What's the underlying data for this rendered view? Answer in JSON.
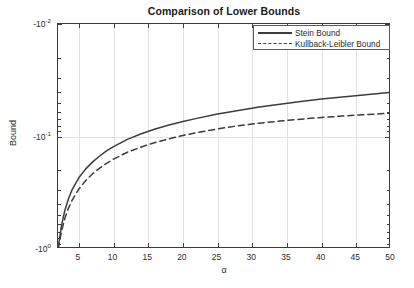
{
  "chart_data": {
    "type": "line",
    "title": "Comparison of Lower Bounds",
    "xlabel": "α",
    "ylabel": "Bound",
    "xlim": [
      2,
      50
    ],
    "ylim": [
      -1,
      -0.01
    ],
    "yscale": "reverse-log",
    "grid": true,
    "legend_position": "top-right",
    "xticks": [
      5,
      10,
      15,
      20,
      25,
      30,
      35,
      40,
      45,
      50
    ],
    "xticklabels": [
      "5",
      "10",
      "15",
      "20",
      "25",
      "30",
      "35",
      "40",
      "45",
      "50"
    ],
    "yticks": [
      -1,
      -0.1,
      -0.01
    ],
    "yticklabels": [
      "-10",
      "-10",
      "-10"
    ],
    "yticklabel_exponents": [
      "0",
      "-1",
      "-2"
    ],
    "series": [
      {
        "name": "Stein Bound",
        "style": "solid",
        "color": "#3c3c3c",
        "x": [
          2,
          2.5,
          3,
          3.5,
          4,
          5,
          6,
          7,
          8,
          9,
          10,
          12,
          14,
          16,
          18,
          20,
          22,
          25,
          28,
          31,
          34,
          37,
          40,
          43,
          46,
          50
        ],
        "y": [
          -1.0,
          -0.62,
          -0.45,
          -0.36,
          -0.3,
          -0.233,
          -0.194,
          -0.168,
          -0.149,
          -0.134,
          -0.123,
          -0.106,
          -0.0945,
          -0.0859,
          -0.0791,
          -0.0736,
          -0.069,
          -0.0632,
          -0.0586,
          -0.0548,
          -0.0516,
          -0.0489,
          -0.0465,
          -0.0445,
          -0.0427,
          -0.0405
        ]
      },
      {
        "name": "Kullback-Leibler Bound",
        "style": "dashed",
        "color": "#3c3c3c",
        "x": [
          2,
          2.5,
          3,
          3.5,
          4,
          5,
          6,
          7,
          8,
          9,
          10,
          12,
          14,
          16,
          18,
          20,
          22,
          25,
          28,
          31,
          34,
          37,
          40,
          43,
          46,
          50
        ],
        "y": [
          -1.0,
          -0.7,
          -0.53,
          -0.435,
          -0.372,
          -0.293,
          -0.246,
          -0.214,
          -0.191,
          -0.173,
          -0.159,
          -0.138,
          -0.124,
          -0.113,
          -0.105,
          -0.0979,
          -0.0924,
          -0.0855,
          -0.0803,
          -0.0762,
          -0.0729,
          -0.0701,
          -0.0678,
          -0.0658,
          -0.0641,
          -0.0621
        ]
      }
    ]
  },
  "chart": {
    "title": "Comparison of Lower Bounds",
    "xlabel": "α",
    "ylabel": "Bound",
    "xticklabels": [
      "5",
      "10",
      "15",
      "20",
      "25",
      "30",
      "35",
      "40",
      "45",
      "50"
    ],
    "yticks": [
      {
        "mantissa": "-10",
        "exponent": "-2"
      },
      {
        "mantissa": "-10",
        "exponent": "-1"
      },
      {
        "mantissa": "-10",
        "exponent": "0"
      }
    ],
    "legend": [
      {
        "label": "Stein Bound",
        "style": "solid"
      },
      {
        "label": "Kullback-Leibler Bound",
        "style": "dashed"
      }
    ],
    "colors": {
      "line": "#3c3c3c",
      "grid": "#e2e2e2",
      "axis": "#3c3c3c",
      "background": "#ffffff",
      "text": "#2b2b2b"
    }
  }
}
